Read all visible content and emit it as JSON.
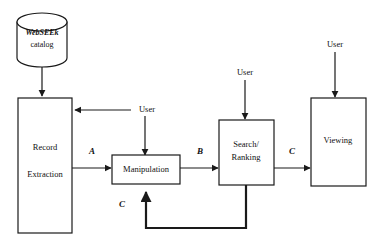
{
  "diagram": {
    "colors": {
      "stroke": "#1a1a1a",
      "fill": "#ffffff",
      "text": "#111111"
    },
    "datastore": {
      "name": "webseek-catalog",
      "line1": "WebSEEk",
      "line2": "catalog"
    },
    "nodes": [
      {
        "id": "record-extraction",
        "line1": "Record",
        "line2": "Extraction"
      },
      {
        "id": "manipulation",
        "line1": "Manipulation",
        "line2": ""
      },
      {
        "id": "search-ranking",
        "line1": "Search/",
        "line2": "Ranking"
      },
      {
        "id": "viewing",
        "line1": "Viewing",
        "line2": ""
      }
    ],
    "actors": [
      {
        "id": "user-record-extraction",
        "label": "User"
      },
      {
        "id": "user-manipulation",
        "label": "User"
      },
      {
        "id": "user-search-ranking",
        "label": "User"
      },
      {
        "id": "user-viewing",
        "label": "User"
      }
    ],
    "edge_labels": [
      {
        "id": "edge-label-a",
        "label": "A"
      },
      {
        "id": "edge-label-b",
        "label": "B"
      },
      {
        "id": "edge-label-c-viewing",
        "label": "C"
      },
      {
        "id": "edge-label-c-feedback",
        "label": "C"
      }
    ]
  }
}
